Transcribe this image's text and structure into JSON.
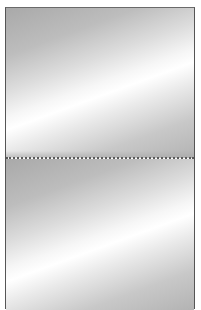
{
  "image": {
    "description": "Two stacked silver metallic gradient panels separated by a dotted line",
    "panels": [
      {
        "id": "top",
        "style": "diagonal-silver-gradient"
      },
      {
        "id": "bottom",
        "style": "diagonal-silver-gradient"
      }
    ],
    "colors": {
      "border": "#555555",
      "divider": "#5a5a5a",
      "gradient_dark": "#a9a9a9",
      "gradient_light": "#ffffff"
    }
  }
}
